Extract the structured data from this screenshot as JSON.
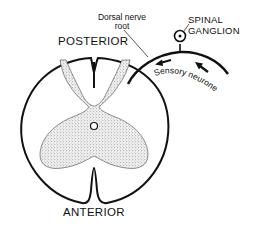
{
  "diagram": {
    "labels": {
      "dorsal_nerve_root_line1": "Dorsal nerve",
      "dorsal_nerve_root_line2": "root",
      "spinal_ganglion_line1": "SPINAL",
      "spinal_ganglion_line2": "GANGLION",
      "posterior": "POSTERIOR",
      "anterior": "ANTERIOR",
      "sensory_neurone": "Sensory neurone"
    },
    "colors": {
      "stroke": "#111111",
      "grey_matter_fill": "#d8d8d8",
      "white_matter_fill": "#ffffff"
    },
    "arrows": {
      "direction": "toward spinal cord",
      "count": 2
    }
  }
}
